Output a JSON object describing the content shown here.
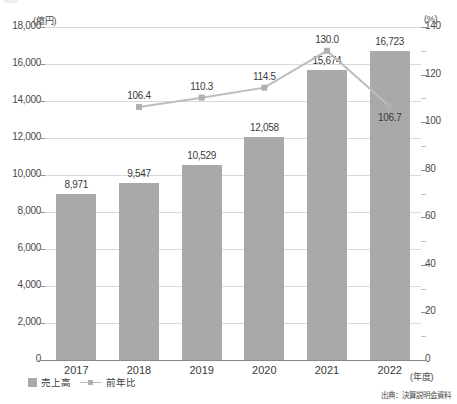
{
  "axes": {
    "left_unit": "(億円)",
    "right_unit": "(%)",
    "x_unit": "(年度)"
  },
  "legend": {
    "bar_label": "売上高",
    "line_label": "前年比"
  },
  "source": "出典：決算説明会資料",
  "chart_data": {
    "type": "bar",
    "title": "",
    "subtitle": "",
    "xlabel": "(年度)",
    "ylabel": "(億円)",
    "y2label": "(%)",
    "categories": [
      "2017",
      "2018",
      "2019",
      "2020",
      "2021",
      "2022"
    ],
    "ylim": [
      0,
      18000
    ],
    "y2lim": [
      0,
      140
    ],
    "yticks": [
      "0",
      "2,000",
      "4,000",
      "6,000",
      "8,000",
      "10,000",
      "12,000",
      "14,000",
      "16,000",
      "18,000"
    ],
    "ytick_values": [
      0,
      2000,
      4000,
      6000,
      8000,
      10000,
      12000,
      14000,
      16000,
      18000
    ],
    "y2ticks": [
      "0",
      "20",
      "40",
      "60",
      "80",
      "100",
      "120",
      "140"
    ],
    "y2tick_values": [
      0,
      20,
      40,
      60,
      80,
      100,
      120,
      140
    ],
    "y2_minor_tick_values": [
      10,
      30,
      50,
      70,
      90,
      110,
      130
    ],
    "grid": true,
    "legend_position": "bottom-left",
    "colors": {
      "bar": "#a9a9a9",
      "line": "#bdbdbd",
      "marker": "#b0b0b0",
      "grid": "#d9d9d9",
      "axis": "#8a8a8a",
      "text": "#3a3a3a"
    },
    "series": [
      {
        "name": "売上高",
        "type": "bar",
        "axis": "left",
        "unit": "億円",
        "values": [
          8971,
          9547,
          10529,
          12058,
          15674,
          16723
        ],
        "labels": [
          "8,971",
          "9,547",
          "10,529",
          "12,058",
          "15,674",
          "16,723"
        ]
      },
      {
        "name": "前年比",
        "type": "line",
        "axis": "right",
        "unit": "%",
        "values": [
          null,
          106.4,
          110.3,
          114.5,
          130.0,
          106.7
        ],
        "labels": [
          "",
          "106.4",
          "110.3",
          "114.5",
          "130.0",
          "106.7"
        ]
      }
    ]
  }
}
